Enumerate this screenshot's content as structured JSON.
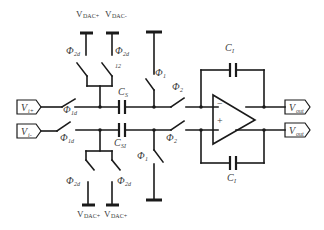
{
  "diagram": {
    "title": "",
    "type": "switched-capacitor fully-differential integrator with DAC feedback",
    "inputs": [
      {
        "id": "vin_plus",
        "label": "V",
        "sub": "i+"
      },
      {
        "id": "vin_minus",
        "label": "V",
        "sub": "i-"
      }
    ],
    "outputs": [
      {
        "id": "vout_top",
        "label": "V",
        "sub": "out"
      },
      {
        "id": "vout_bottom",
        "label": "V",
        "sub": "out"
      }
    ],
    "dac_refs_top": [
      {
        "label": "V",
        "sub": "DAC+"
      },
      {
        "label": "V",
        "sub": "DAC-"
      }
    ],
    "dac_refs_bottom": [
      {
        "label": "V",
        "sub": "DAC+"
      },
      {
        "label": "V",
        "sub": "DAC+"
      }
    ],
    "capacitors": {
      "sampling_top": {
        "label": "C",
        "sub": "S"
      },
      "sampling_bottom": {
        "label": "C",
        "sub": "SI"
      },
      "integrating_top": {
        "label": "C",
        "sub": "I"
      },
      "integrating_bottom": {
        "label": "C",
        "sub": "I"
      }
    },
    "switches": {
      "in_top": {
        "label": "Φ",
        "sub": "1d"
      },
      "in_bottom": {
        "label": "Φ",
        "sub": "1d"
      },
      "dac_top_left": {
        "label": "Φ",
        "sub": "2d"
      },
      "dac_top_right": {
        "label": "Φ",
        "sub": "2d"
      },
      "dac_top_right_note": "12",
      "dac_bot_left": {
        "label": "Φ",
        "sub": "2d"
      },
      "dac_bot_right": {
        "label": "Φ",
        "sub": "2d"
      },
      "gnd_top": {
        "label": "Φ",
        "sub": "1"
      },
      "gnd_bottom": {
        "label": "Φ",
        "sub": "1"
      },
      "out_top": {
        "label": "Φ",
        "sub": "2"
      },
      "out_bottom": {
        "label": "Φ",
        "sub": "2"
      }
    },
    "opamp": {
      "minus": "−",
      "plus": "+"
    },
    "colors": {
      "line": "#1a1a1a",
      "text": "#3a3a3a",
      "background": "#ffffff"
    }
  }
}
